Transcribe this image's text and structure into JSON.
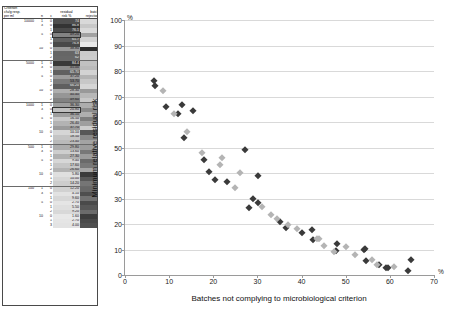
{
  "table": {
    "header": {
      "criterion": "Criterion",
      "criterion_sub": "cfu/g resp.",
      "criterion_sub2": "per ml",
      "n": "n",
      "c": "c",
      "residual": "residual",
      "residual_sub": "risk %",
      "batch": "batch",
      "batch_sub": "rejection %"
    },
    "groups": [
      {
        "criterion": "10000",
        "rows": [
          {
            "n": "1",
            "c": "0",
            "residual": "74",
            "rejection": "6.8"
          },
          {
            "n": "3",
            "c": "0",
            "residual": "86.8",
            "rejection": "12.8"
          },
          {
            "n": "",
            "c": "1",
            "residual": "76.1",
            "rejection": "6.5"
          },
          {
            "n": "5",
            "c": "0",
            "residual": "49.20",
            "rejection": "27.20",
            "boxed": true
          },
          {
            "n": "",
            "c": "1",
            "residual": "65.7",
            "rejection": "9.3"
          },
          {
            "n": "",
            "c": "0",
            "residual": "76.8",
            "rejection": "1.1"
          },
          {
            "n": "10",
            "c": "0",
            "residual": "38.80",
            "rejection": "110.00"
          },
          {
            "n": "",
            "c": "1",
            "residual": "63",
            "rejection": "12"
          },
          {
            "n": "",
            "c": "2",
            "residual": "62",
            "rejection": "11.50"
          }
        ]
      },
      {
        "criterion": "5000",
        "rows": [
          {
            "n": "1",
            "c": "0",
            "residual": "84.4",
            "rejection": "15.4"
          },
          {
            "n": "3",
            "c": "0",
            "residual": "45.00",
            "rejection": "18.00"
          },
          {
            "n": "",
            "c": "1",
            "residual": "65.70",
            "rejection": "9.00"
          },
          {
            "n": "5",
            "c": "0",
            "residual": "37.20",
            "rejection": "20.40"
          },
          {
            "n": "",
            "c": "1",
            "residual": "53.70",
            "rejection": "13.40"
          },
          {
            "n": "",
            "c": "2",
            "residual": "66.20",
            "rejection": "8.10"
          },
          {
            "n": "10",
            "c": "0",
            "residual": "28.30",
            "rejection": "30.20"
          },
          {
            "n": "",
            "c": "1",
            "residual": "40.40",
            "rejection": "19.01"
          },
          {
            "n": "",
            "c": "2",
            "residual": "49.60",
            "rejection": "13.12"
          }
        ]
      },
      {
        "criterion": "1000",
        "rows": [
          {
            "n": "1",
            "c": "0",
            "residual": "36.30",
            "rejection": "23.00"
          },
          {
            "n": "3",
            "c": "0",
            "residual": "20.80",
            "rejection": "35.20",
            "boxed": true
          },
          {
            "n": "",
            "c": "1",
            "residual": "36.10",
            "rejection": "22.00"
          },
          {
            "n": "5",
            "c": "0",
            "residual": "16.50",
            "rejection": "40.10"
          },
          {
            "n": "",
            "c": "1",
            "residual": "26.40",
            "rejection": "28.10"
          },
          {
            "n": "",
            "c": "2",
            "residual": "37.70",
            "rejection": "11.10"
          },
          {
            "n": "10",
            "c": "0",
            "residual": "10.10",
            "rejection": "54.40"
          },
          {
            "n": "",
            "c": "1",
            "residual": "18.50",
            "rejection": "36.40"
          },
          {
            "n": "",
            "c": "2",
            "residual": "23.40",
            "rejection": "26.40"
          }
        ]
      },
      {
        "criterion": "500",
        "rows": [
          {
            "n": "1",
            "c": "0",
            "residual": "29.80",
            "rejection": "29.00"
          },
          {
            "n": "3",
            "c": "0",
            "residual": "13.60",
            "rejection": "42.70"
          },
          {
            "n": "",
            "c": "1",
            "residual": "27.30",
            "rejection": "29.40"
          },
          {
            "n": "5",
            "c": "0",
            "residual": "9.40",
            "rejection": "47.70"
          },
          {
            "n": "",
            "c": "1",
            "residual": "17.60",
            "rejection": "42.40"
          },
          {
            "n": "",
            "c": "2",
            "residual": "26.60",
            "rejection": "25.31"
          },
          {
            "n": "10",
            "c": "0",
            "residual": "5.80",
            "rejection": "64.70"
          },
          {
            "n": "",
            "c": "1",
            "residual": "10.00",
            "rejection": "54.20"
          },
          {
            "n": "",
            "c": "2",
            "residual": "14.20",
            "rejection": "43.40"
          }
        ]
      },
      {
        "criterion": "100",
        "rows": [
          {
            "n": "1",
            "c": "0",
            "residual": "12.20",
            "rejection": "48.10"
          },
          {
            "n": "3",
            "c": "0",
            "residual": "4.10",
            "rejection": "57.50"
          },
          {
            "n": "",
            "c": "1",
            "residual": "9.60",
            "rejection": "44.40"
          },
          {
            "n": "5",
            "c": "0",
            "residual": "2.70",
            "rejection": "59.20"
          },
          {
            "n": "",
            "c": "1",
            "residual": "5.50",
            "rejection": "54.60"
          },
          {
            "n": "",
            "c": "2",
            "residual": "9.20",
            "rejection": "47.30"
          },
          {
            "n": "10",
            "c": "0",
            "residual": "1.60",
            "rejection": "64.00"
          },
          {
            "n": "",
            "c": "1",
            "residual": "2.70",
            "rejection": "59.60"
          },
          {
            "n": "",
            "c": "3",
            "residual": "4.00",
            "rejection": "57.20"
          }
        ]
      }
    ]
  },
  "chart_data": {
    "type": "scatter",
    "title": "",
    "xlabel": "Batches not complying to microbiological criterion",
    "ylabel": "Minimum relative residual risk",
    "x_unit": "%",
    "y_unit": "%",
    "xlim": [
      0,
      70
    ],
    "ylim": [
      0,
      100
    ],
    "xticks": [
      0,
      10,
      20,
      30,
      40,
      50,
      60,
      70
    ],
    "yticks": [
      0,
      10,
      20,
      30,
      40,
      50,
      60,
      70,
      80,
      90,
      100
    ],
    "grid": "horizontal",
    "legend": "none",
    "series": [
      {
        "name": "dark",
        "color": "#3a3a3a",
        "points": [
          [
            6.8,
            74.0
          ],
          [
            12.8,
            66.8
          ],
          [
            6.5,
            76.1
          ],
          [
            27.2,
            49.2
          ],
          [
            9.3,
            65.7
          ],
          [
            30.2,
            38.8
          ],
          [
            12.0,
            63.0
          ],
          [
            15.4,
            64.4
          ],
          [
            18.0,
            45.0
          ],
          [
            20.4,
            37.2
          ],
          [
            13.4,
            53.7
          ],
          [
            30.2,
            28.3
          ],
          [
            19.0,
            40.4
          ],
          [
            23.0,
            36.3
          ],
          [
            35.2,
            20.8
          ],
          [
            40.1,
            16.5
          ],
          [
            28.1,
            26.4
          ],
          [
            54.4,
            10.1
          ],
          [
            36.4,
            18.5
          ],
          [
            29.0,
            29.8
          ],
          [
            42.7,
            13.6
          ],
          [
            47.7,
            9.4
          ],
          [
            42.4,
            17.6
          ],
          [
            64.7,
            5.8
          ],
          [
            54.2,
            10.0
          ],
          [
            48.1,
            12.2
          ],
          [
            57.5,
            4.1
          ],
          [
            59.2,
            2.7
          ],
          [
            54.6,
            5.5
          ],
          [
            64.0,
            1.6
          ],
          [
            59.6,
            2.7
          ]
        ]
      },
      {
        "name": "light",
        "color": "#b4b4b4",
        "points": [
          [
            8.5,
            72.0
          ],
          [
            11.0,
            63.0
          ],
          [
            22.0,
            46.0
          ],
          [
            14.0,
            56.0
          ],
          [
            26.0,
            40.0
          ],
          [
            17.5,
            48.0
          ],
          [
            33.0,
            23.4
          ],
          [
            21.5,
            43.0
          ],
          [
            37.0,
            19.8
          ],
          [
            25.0,
            34.0
          ],
          [
            44.0,
            14.2
          ],
          [
            31.0,
            26.6
          ],
          [
            50.0,
            11.0
          ],
          [
            43.4,
            14.2
          ],
          [
            57.2,
            4.0
          ],
          [
            47.3,
            9.2
          ],
          [
            61.0,
            3.0
          ],
          [
            52.0,
            8.0
          ],
          [
            56.0,
            6.0
          ],
          [
            45.0,
            11.5
          ],
          [
            39.0,
            18.0
          ],
          [
            34.5,
            22.0
          ]
        ]
      }
    ]
  }
}
